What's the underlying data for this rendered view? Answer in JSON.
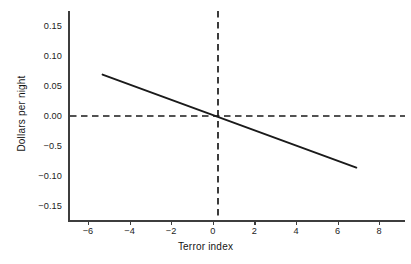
{
  "chart_data": {
    "type": "line",
    "title": "",
    "xlabel": "Terror index",
    "ylabel": "Dollars per night",
    "xlim": [
      -6.95,
      9.2
    ],
    "ylim": [
      -0.175,
      0.175
    ],
    "xticks": [
      -6,
      -4,
      -2,
      0,
      2,
      4,
      6,
      8
    ],
    "xticklabels": [
      "−6",
      "−4",
      "−2",
      "0",
      "2",
      "4",
      "6",
      "8"
    ],
    "yticks": [
      0.15,
      0.1,
      0.05,
      0.0,
      -0.05,
      -0.1,
      -0.15
    ],
    "yticklabels": [
      "0.15",
      "0.10",
      "0.05",
      "0.00",
      "−0.5",
      "−0.10",
      "−0.15"
    ],
    "grid": false,
    "legend": null,
    "series": [
      {
        "name": "Fitted regression line",
        "style": "solid",
        "color": "#1a1a1a",
        "x": [
          -5.3,
          6.9
        ],
        "y": [
          0.069,
          -0.086
        ]
      }
    ],
    "reference_lines": [
      {
        "name": "zero-dollars-line",
        "orientation": "horizontal",
        "value": 0.0,
        "style": "dashed",
        "color": "#1a1a1a"
      },
      {
        "name": "zero-terror-index-line",
        "orientation": "vertical",
        "value": 0.25,
        "style": "dashed",
        "color": "#1a1a1a"
      }
    ],
    "annotations": []
  },
  "figure": {
    "caption": ""
  }
}
